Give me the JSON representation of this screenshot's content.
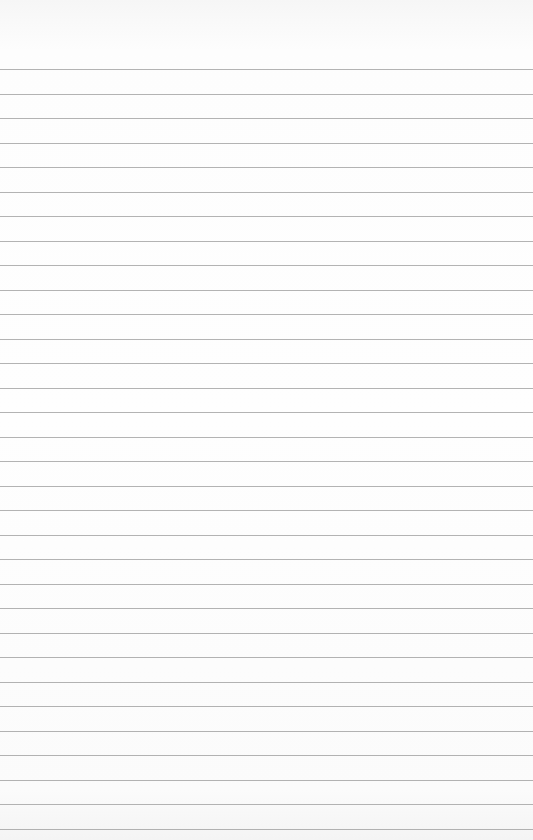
{
  "page": {
    "type": "blank lined paper",
    "line_count": 32,
    "first_line_y": 69,
    "line_spacing_px": 24.5,
    "line_color": "#9a9a9a",
    "paper_color": "#fdfdfd"
  }
}
